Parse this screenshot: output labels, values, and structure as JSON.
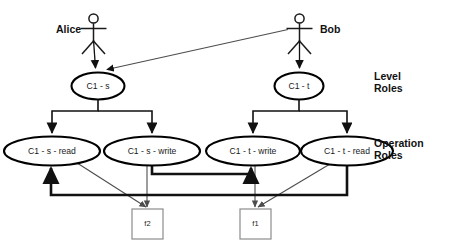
{
  "diagram": {
    "colors": {
      "background": "#ffffff",
      "stroke": "#111111",
      "thin_edge": "#4d4d4d",
      "file_box_stroke": "#8c8c8c"
    },
    "actors": [
      {
        "id": "alice",
        "name": "Alice",
        "label_x": 56,
        "label_y": 30,
        "figure_x": 93,
        "figure_y": 14
      },
      {
        "id": "bob",
        "name": "Bob",
        "label_x": 320,
        "label_y": 30,
        "figure_x": 299,
        "figure_y": 14
      }
    ],
    "level_roles": [
      {
        "id": "c1s",
        "label": "C1 - s",
        "cx": 98,
        "cy": 86,
        "rx": 26,
        "ry": 13
      },
      {
        "id": "c1t",
        "label": "C1 - t",
        "cx": 299,
        "cy": 86,
        "rx": 24,
        "ry": 13
      }
    ],
    "operation_roles": [
      {
        "id": "c1sread",
        "label": "C1 - s - read",
        "cx": 52,
        "cy": 151,
        "rx": 47,
        "ry": 14
      },
      {
        "id": "c1swrite",
        "label": "C1 - s - write",
        "cx": 152,
        "cy": 151,
        "rx": 47,
        "ry": 14
      },
      {
        "id": "c1twrite",
        "label": "C1 - t - write",
        "cx": 253,
        "cy": 151,
        "rx": 46,
        "ry": 14
      },
      {
        "id": "c1tread",
        "label": "C1 - t - read",
        "cx": 347,
        "cy": 151,
        "rx": 45,
        "ry": 14
      }
    ],
    "files": [
      {
        "id": "f2",
        "label": "f2",
        "x": 132,
        "y": 209,
        "w": 31,
        "h": 30
      },
      {
        "id": "f1",
        "label": "f1",
        "x": 240,
        "y": 209,
        "w": 31,
        "h": 30
      }
    ],
    "side_labels": [
      {
        "id": "level-roles",
        "line1": "Level",
        "line2": "Roles",
        "x": 374,
        "y": 76
      },
      {
        "id": "operation-roles",
        "line1": "Operation",
        "line2": "Roles",
        "x": 374,
        "y": 143
      }
    ],
    "edges": {
      "actor_assignments": [
        {
          "id": "alice-to-c1s",
          "from": "alice",
          "to": "c1s"
        },
        {
          "id": "bob-to-c1t",
          "from": "bob",
          "to": "c1t"
        },
        {
          "id": "bob-to-c1s",
          "from": "bob",
          "to": "c1s"
        }
      ],
      "hierarchy": [
        {
          "id": "c1s-to-c1sread",
          "from": "c1s",
          "to": "c1sread"
        },
        {
          "id": "c1s-to-c1swrite",
          "from": "c1s",
          "to": "c1swrite"
        },
        {
          "id": "c1t-to-c1twrite",
          "from": "c1t",
          "to": "c1twrite"
        },
        {
          "id": "c1t-to-c1tread",
          "from": "c1t",
          "to": "c1tread"
        }
      ],
      "inheritance": [
        {
          "id": "c1swrite-to-c1twrite",
          "from": "c1swrite",
          "to": "c1twrite"
        },
        {
          "id": "c1tread-to-c1sread",
          "from": "c1tread",
          "to": "c1sread"
        }
      ],
      "permissions": [
        {
          "id": "c1sread-f2",
          "from": "c1sread",
          "to": "f2"
        },
        {
          "id": "c1swrite-f2",
          "from": "c1swrite",
          "to": "f2"
        },
        {
          "id": "c1twrite-f1",
          "from": "c1twrite",
          "to": "f1"
        },
        {
          "id": "c1tread-f1",
          "from": "c1tread",
          "to": "f1"
        }
      ]
    }
  }
}
